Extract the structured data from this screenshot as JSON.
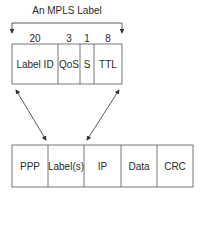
{
  "title": "An MPLS Label",
  "label_fields": [
    {
      "bits": "20",
      "name": "Label ID"
    },
    {
      "bits": "3",
      "name": "QoS"
    },
    {
      "bits": "1",
      "name": "S"
    },
    {
      "bits": "8",
      "name": "TTL"
    }
  ],
  "packet_fields": [
    "PPP",
    "Label(s)",
    "IP",
    "Data",
    "CRC"
  ]
}
